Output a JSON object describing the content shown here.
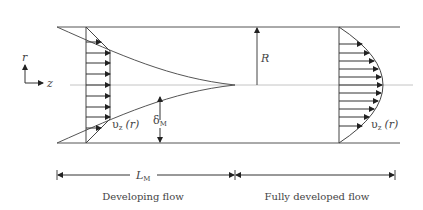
{
  "diagram": {
    "axes": {
      "r_label": "r",
      "z_label": "z"
    },
    "labels": {
      "radius": "R",
      "bl_thickness_main": "δ",
      "bl_thickness_sub": "M",
      "entrance_length_main": "L",
      "entrance_length_sub": "M",
      "velocity_developing_main": "υ",
      "velocity_developing_sub": "z",
      "velocity_developing_arg": "(r)",
      "velocity_developed_main": "υ",
      "velocity_developed_sub": "z",
      "velocity_developed_arg": "(r)"
    },
    "regions": [
      {
        "label": "Developing flow"
      },
      {
        "label": "Fully developed flow"
      }
    ],
    "colors": {
      "wall": "#555555",
      "centerline": "#c4c4c4",
      "arrow": "#333333",
      "text": "#444444"
    }
  }
}
